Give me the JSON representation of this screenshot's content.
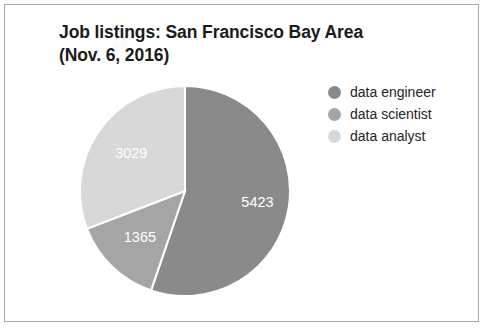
{
  "chart_data": {
    "type": "pie",
    "title": "Job listings: San Francisco Bay Area (Nov. 6, 2016)",
    "title_lines": [
      "Job listings: San Francisco Bay Area",
      "(Nov. 6, 2016)"
    ],
    "categories": [
      "data engineer",
      "data scientist",
      "data analyst"
    ],
    "values": [
      5423,
      1365,
      3029
    ],
    "value_labels": [
      "5423",
      "1365",
      "3029"
    ],
    "colors": [
      "#8a8a8a",
      "#a5a5a5",
      "#d8d8d8"
    ],
    "total": 9817,
    "start_angle_deg": 0,
    "direction": "clockwise",
    "legend_position": "right",
    "grid": false,
    "xlabel": "",
    "ylabel": "",
    "slice_label_color": "#ffffff",
    "slices": [
      {
        "label": "data engineer",
        "value": 5423,
        "value_label": "5423",
        "color": "#8a8a8a",
        "percent": 55.24,
        "angle_deg": 198.9
      },
      {
        "label": "data scientist",
        "value": 1365,
        "value_label": "1365",
        "color": "#a5a5a5",
        "percent": 13.9,
        "angle_deg": 50.1
      },
      {
        "label": "data analyst",
        "value": 3029,
        "value_label": "3029",
        "color": "#d8d8d8",
        "percent": 30.85,
        "angle_deg": 111.1
      }
    ]
  },
  "legend": {
    "items": [
      {
        "label": "data engineer",
        "color": "#8a8a8a"
      },
      {
        "label": "data scientist",
        "color": "#a5a5a5"
      },
      {
        "label": "data analyst",
        "color": "#d8d8d8"
      }
    ]
  },
  "frame": {
    "background": "#ffffff",
    "border_color": "#a9a9a9"
  }
}
